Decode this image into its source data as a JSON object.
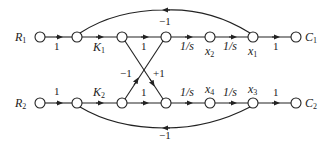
{
  "diagram": {
    "type": "signal-flow-graph",
    "nodes": {
      "top": [
        {
          "id": "R1",
          "label": "R",
          "sub": "1",
          "x": 40,
          "y": 37
        },
        {
          "id": "t1",
          "label": "",
          "x": 77,
          "y": 37
        },
        {
          "id": "t2",
          "label": "",
          "x": 122,
          "y": 37
        },
        {
          "id": "t3",
          "label": "",
          "x": 166,
          "y": 37
        },
        {
          "id": "x2",
          "label": "x",
          "sub": "2",
          "x": 210,
          "y": 37
        },
        {
          "id": "x1",
          "label": "x",
          "sub": "1",
          "x": 253,
          "y": 37
        },
        {
          "id": "C1",
          "label": "C",
          "sub": "1",
          "x": 296,
          "y": 37
        }
      ],
      "bottom": [
        {
          "id": "R2",
          "label": "R",
          "sub": "2",
          "x": 40,
          "y": 103
        },
        {
          "id": "b1",
          "label": "",
          "x": 77,
          "y": 103
        },
        {
          "id": "b2",
          "label": "",
          "x": 122,
          "y": 103
        },
        {
          "id": "b3",
          "label": "",
          "x": 166,
          "y": 103
        },
        {
          "id": "x4",
          "label": "x",
          "sub": "4",
          "x": 210,
          "y": 103
        },
        {
          "id": "x3",
          "label": "x",
          "sub": "3",
          "x": 253,
          "y": 103
        },
        {
          "id": "C2",
          "label": "C",
          "sub": "2",
          "x": 296,
          "y": 103
        }
      ]
    },
    "edges": [
      {
        "from": "R1",
        "to": "t1",
        "gain": "1"
      },
      {
        "from": "t1",
        "to": "t2",
        "gain": "K",
        "gain_sub": "1"
      },
      {
        "from": "t2",
        "to": "t3",
        "gain": "1"
      },
      {
        "from": "t3",
        "to": "x2",
        "gain": "1/s"
      },
      {
        "from": "x2",
        "to": "x1",
        "gain": "1/s"
      },
      {
        "from": "x1",
        "to": "C1",
        "gain": "1"
      },
      {
        "from": "x1",
        "to": "t1",
        "gain": "−1",
        "kind": "feedback-top"
      },
      {
        "from": "R2",
        "to": "b1",
        "gain": "1"
      },
      {
        "from": "b1",
        "to": "b2",
        "gain": "K",
        "gain_sub": "2"
      },
      {
        "from": "b2",
        "to": "b3",
        "gain": "1"
      },
      {
        "from": "b3",
        "to": "x4",
        "gain": "1/s"
      },
      {
        "from": "x4",
        "to": "x3",
        "gain": "1/s"
      },
      {
        "from": "x3",
        "to": "C2",
        "gain": "1"
      },
      {
        "from": "x3",
        "to": "b1",
        "gain": "−1",
        "kind": "feedback-bottom"
      },
      {
        "from": "t2",
        "to": "b3",
        "gain": "+1",
        "kind": "cross"
      },
      {
        "from": "b2",
        "to": "t3",
        "gain": "−1",
        "kind": "cross"
      }
    ],
    "labels": {
      "R1": "R",
      "R1_sub": "1",
      "R2": "R",
      "R2_sub": "2",
      "C1": "C",
      "C1_sub": "1",
      "C2": "C",
      "C2_sub": "2",
      "x1": "x",
      "x1_sub": "1",
      "x2": "x",
      "x2_sub": "2",
      "x3": "x",
      "x3_sub": "3",
      "x4": "x",
      "x4_sub": "4",
      "K1": "K",
      "K1_sub": "1",
      "K2": "K",
      "K2_sub": "2",
      "one": "1",
      "inv_s": "1/s",
      "neg_one": "−1",
      "pos_one": "+1"
    }
  }
}
